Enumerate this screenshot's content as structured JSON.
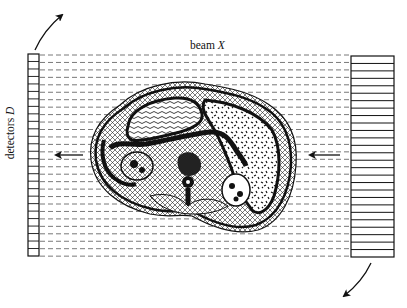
{
  "figure": {
    "beam_label": "beam",
    "beam_symbol": "X",
    "detector_label": "detectors",
    "detector_symbol": "D",
    "colors": {
      "ink": "#111111",
      "background": "#ffffff",
      "dashed_line": "#555555"
    },
    "layout": {
      "detector_array": {
        "x": 28,
        "y": 54,
        "width": 11,
        "height": 202,
        "cells": 27
      },
      "source_array": {
        "x": 351,
        "y": 56,
        "width": 43,
        "height": 201,
        "stripes": 27
      },
      "beam_lines": {
        "count": 28,
        "x_start": 40,
        "x_end": 351,
        "y_start": 55,
        "spacing": 7.45
      },
      "body_cross_section": {
        "cx": 193,
        "cy": 156,
        "approx_width": 207,
        "approx_height": 153
      },
      "arrows": [
        {
          "name": "rotation-arrow-top-left",
          "direction": "up-right"
        },
        {
          "name": "rotation-arrow-bottom-right",
          "direction": "down-left"
        },
        {
          "name": "beam-arrow-exit",
          "direction": "left"
        },
        {
          "name": "beam-arrow-entry",
          "direction": "left"
        }
      ]
    }
  }
}
